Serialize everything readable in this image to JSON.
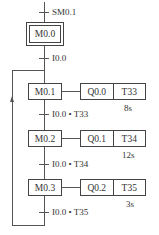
{
  "diagram": {
    "type": "sequential-function-chart",
    "initial_transition": "SM0.1",
    "initial_step": "M0.0",
    "transition_0": "I0.0",
    "steps": [
      {
        "name": "M0.1",
        "output": "Q0.0",
        "timer": "T33",
        "time": "8s",
        "transition": "I0.0 • T33"
      },
      {
        "name": "M0.2",
        "output": "Q0.1",
        "timer": "T34",
        "time": "12s",
        "transition": "I0.0 • T34"
      },
      {
        "name": "M0.3",
        "output": "Q0.2",
        "timer": "T35",
        "time": "3s",
        "transition": "I0.0 • T35"
      }
    ],
    "line_color": "#555555"
  }
}
